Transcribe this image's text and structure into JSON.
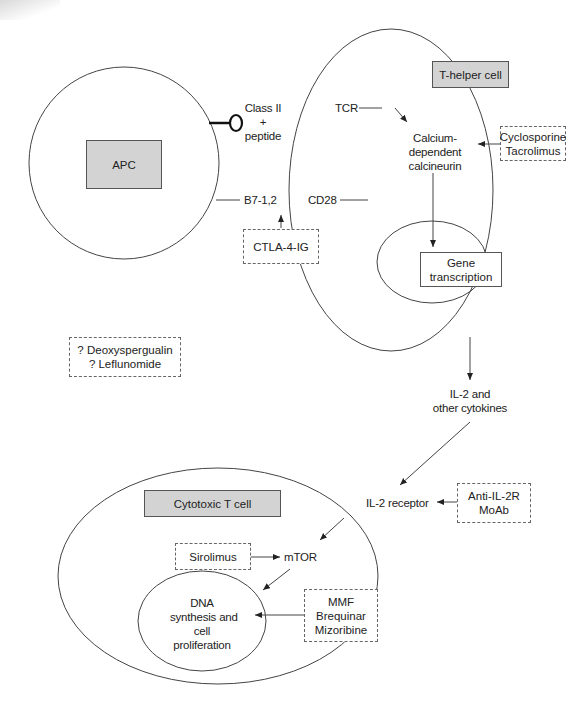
{
  "diagram": {
    "cells": {
      "apc": {
        "label": "APC"
      },
      "t_helper": {
        "label": "T-helper cell"
      },
      "cytotoxic": {
        "label": "Cytotoxic T cell"
      }
    },
    "molecules": {
      "class_ii_line1": "Class II",
      "class_ii_line2": "+",
      "class_ii_line3": "peptide",
      "tcr": "TCR",
      "b7": "B7-1,2",
      "cd28": "CD28",
      "calcineurin_line1": "Calcium-",
      "calcineurin_line2": "dependent",
      "calcineurin_line3": "calcineurin",
      "gene_line1": "Gene",
      "gene_line2": "transcription",
      "il2_line1": "IL-2 and",
      "il2_line2": "other cytokines",
      "il2_receptor": "IL-2 receptor",
      "mtor": "mTOR",
      "dna_line1": "DNA",
      "dna_line2": "synthesis and",
      "dna_line3": "cell",
      "dna_line4": "proliferation"
    },
    "drugs": {
      "cyclosporine": "Cyclosporine",
      "tacrolimus": "Tacrolimus",
      "ctla4": "CTLA-4-IG",
      "deoxyspergualin": "? Deoxyspergualin",
      "leflunomide": "? Leflunomide",
      "anti_il2r_line1": "Anti-IL-2R",
      "anti_il2r_line2": "MoAb",
      "sirolimus": "Sirolimus",
      "mmf": "MMF",
      "brequinar": "Brequinar",
      "mizoribine": "Mizoribine"
    }
  }
}
